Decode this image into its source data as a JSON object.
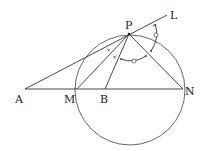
{
  "diagram": {
    "points": {
      "A": {
        "label": "A",
        "x": 25,
        "y": 89
      },
      "M": {
        "label": "M",
        "x": 77,
        "y": 89
      },
      "B": {
        "label": "B",
        "x": 105,
        "y": 89
      },
      "N": {
        "label": "N",
        "x": 183,
        "y": 89
      },
      "P": {
        "label": "P",
        "x": 129,
        "y": 34
      },
      "L": {
        "label": "L",
        "x": 167,
        "y": 15
      }
    },
    "circle": {
      "cx": 130,
      "cy": 90,
      "r": 55
    },
    "segments": [
      "A-N",
      "A-L",
      "P-M",
      "P-B",
      "P-N"
    ],
    "angle_marks": {
      "cross": "×",
      "circle": "o"
    }
  }
}
